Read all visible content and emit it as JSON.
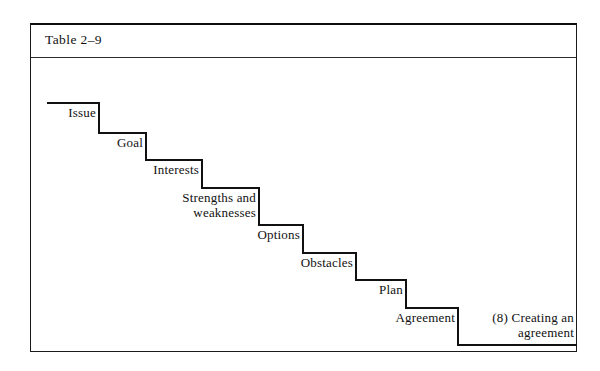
{
  "table": {
    "caption": "Table 2–9"
  },
  "diagram": {
    "type": "staircase",
    "steps": [
      {
        "label": "Issue",
        "tread_y": 45,
        "riser_x": 68,
        "label_right": 66,
        "label_top": 47
      },
      {
        "label": "Goal",
        "tread_y": 75,
        "riser_x": 115,
        "label_right": 113,
        "label_top": 77
      },
      {
        "label": "Interests",
        "tread_y": 102,
        "riser_x": 171,
        "label_right": 169,
        "label_top": 104
      },
      {
        "label": "Strengths and\nweaknesses",
        "tread_y": 130,
        "riser_x": 228,
        "label_right": 226,
        "label_top": 132
      },
      {
        "label": "Options",
        "tread_y": 167,
        "riser_x": 272,
        "label_right": 270,
        "label_top": 169
      },
      {
        "label": "Obstacles",
        "tread_y": 195,
        "riser_x": 325,
        "label_right": 323,
        "label_top": 197
      },
      {
        "label": "Plan",
        "tread_y": 222,
        "riser_x": 375,
        "label_right": 373,
        "label_top": 224
      },
      {
        "label": "Agreement",
        "tread_y": 250,
        "riser_x": 427,
        "label_right": 425,
        "label_top": 252
      }
    ],
    "outcome": {
      "label": "(8) Creating an\nagreement",
      "label_left": 433,
      "label_top": 252,
      "label_width": 110,
      "base_y": 287,
      "base_x_end": 546
    },
    "stroke_color": "#111111",
    "stroke_width": 2,
    "start_x": 17
  }
}
